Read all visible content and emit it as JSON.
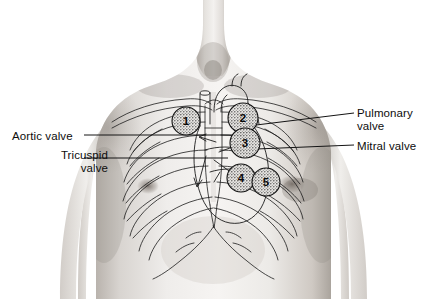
{
  "figure": {
    "background_color": "#ffffff",
    "line_color": "#1a1a1a",
    "skin_light": "#f2f0ee",
    "skin_mid": "#d9d5d1",
    "skin_shadow": "#a9a39d",
    "stipple_color": "#6b6b6b"
  },
  "labels": {
    "aortic": {
      "text": "Aortic valve",
      "lines": [
        "Aortic valve"
      ],
      "side": "left",
      "points_to": "site-1"
    },
    "tricuspid": {
      "text": "Tricuspid valve",
      "lines": [
        "Tricuspid",
        "valve"
      ],
      "side": "left",
      "points_to": "site-4"
    },
    "pulmonary": {
      "text": "Pulmonary valve",
      "lines": [
        "Pulmonary",
        "valve"
      ],
      "side": "right",
      "points_to": "site-2"
    },
    "mitral": {
      "text": "Mitral valve",
      "lines": [
        "Mitral valve"
      ],
      "side": "right",
      "points_to": "site-3"
    }
  },
  "auscultation_sites": [
    {
      "number": "1",
      "name": "aortic-area",
      "cx": 186,
      "cy": 121,
      "r": 14
    },
    {
      "number": "2",
      "name": "pulmonic-area",
      "cx": 243,
      "cy": 118,
      "r": 15
    },
    {
      "number": "3",
      "name": "erbs-point-area",
      "cx": 245,
      "cy": 143,
      "r": 15
    },
    {
      "number": "4",
      "name": "tricuspid-area",
      "cx": 241,
      "cy": 178,
      "r": 14
    },
    {
      "number": "5",
      "name": "mitral-apex-area",
      "cx": 266,
      "cy": 182,
      "r": 14
    }
  ],
  "leader_lines": [
    {
      "name": "aortic-leader",
      "x1": 84,
      "y1": 135,
      "x2": 247,
      "y2": 135
    },
    {
      "name": "tricuspid-leader",
      "x1": 84,
      "y1": 158,
      "x2": 228,
      "y2": 158
    },
    {
      "name": "pulmonary-leader",
      "x1": 354,
      "y1": 113,
      "x2": 248,
      "y2": 126
    },
    {
      "name": "mitral-leader",
      "x1": 354,
      "y1": 145,
      "x2": 232,
      "y2": 150
    }
  ]
}
